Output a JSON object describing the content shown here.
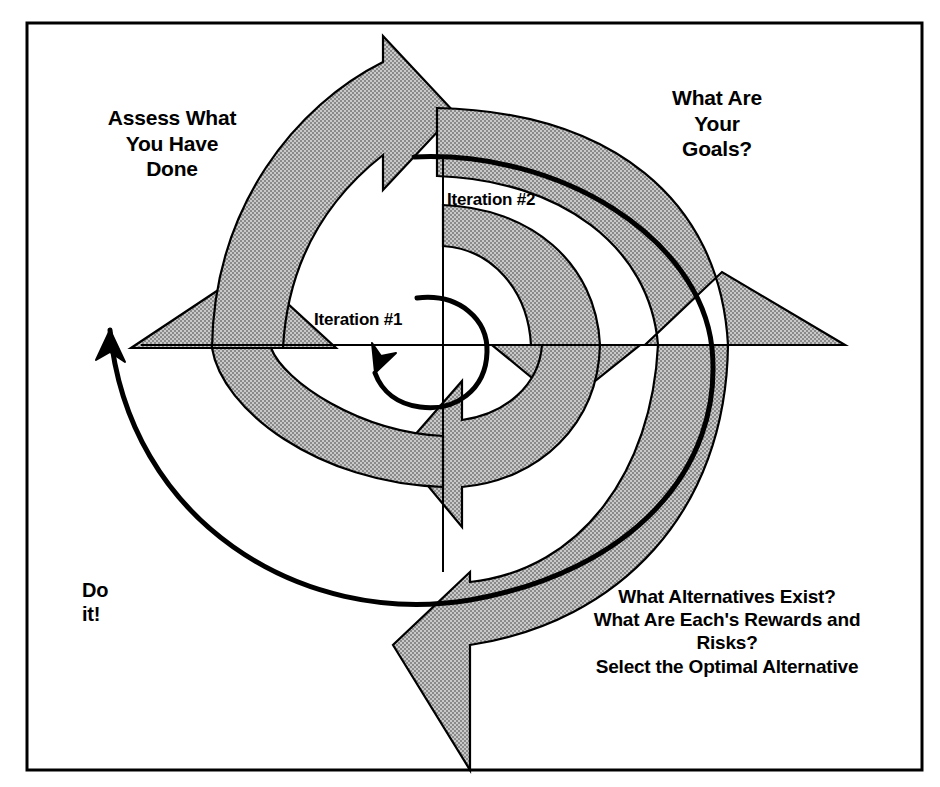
{
  "diagram": {
    "frame": {
      "border_color": "#000000",
      "background": "#ffffff"
    },
    "style": {
      "arrow_fill": "#b3b3b3",
      "arrow_stroke": "#000000",
      "spiral_stroke": "#000000",
      "axis_stroke": "#000000"
    },
    "labels": {
      "assess": "Assess What\nYou Have\nDone",
      "goals": "What Are\nYour\nGoals?",
      "iteration2": "Iteration #2",
      "iteration1": "Iteration #1",
      "do_it": "Do\nit!",
      "alternatives": "What Alternatives Exist?\nWhat Are Each's Rewards and\nRisks?\nSelect the Optimal Alternative"
    },
    "quadrants": [
      {
        "name": "upper-right",
        "label": "What Are Your Goals?"
      },
      {
        "name": "lower-right",
        "label": "What Alternatives Exist? What Are Each's Rewards and Risks? Select the Optimal Alternative"
      },
      {
        "name": "lower-left",
        "label": "Do it!"
      },
      {
        "name": "upper-left",
        "label": "Assess What You Have Done"
      }
    ],
    "iterations": [
      "Iteration #1",
      "Iteration #2"
    ]
  }
}
